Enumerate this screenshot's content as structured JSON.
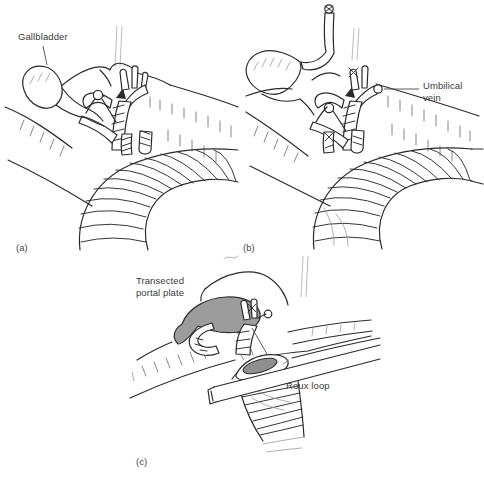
{
  "figure": {
    "type": "surgical-line-illustration",
    "panels": [
      {
        "id": "a",
        "letter": "(a)",
        "labels": {
          "gallbladder": "Gallbladder"
        }
      },
      {
        "id": "b",
        "letter": "(b)",
        "labels": {
          "umbilical_vein": "Umbilical vein"
        }
      },
      {
        "id": "c",
        "letter": "(c)",
        "labels": {
          "transected_portal_plate": "Transected portal plate",
          "roux_loop": "Roux loop"
        }
      }
    ],
    "colors": {
      "background": "#ffffff",
      "ink": "#2b2b2b",
      "texture": "#787878",
      "faint_lines": "#bcbcbc",
      "label_text": "#3a3a3a",
      "portal_plate_fill": "#9c9c9c",
      "enterotomy_fill": "#8f8f8f"
    }
  }
}
